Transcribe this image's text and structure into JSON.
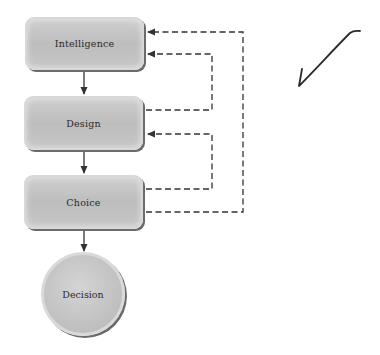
{
  "diagram": {
    "nodes": [
      {
        "id": "intelligence",
        "label": "Intelligence",
        "shape": "rounded-rect"
      },
      {
        "id": "design",
        "label": "Design",
        "shape": "rounded-rect"
      },
      {
        "id": "choice",
        "label": "Choice",
        "shape": "rounded-rect"
      },
      {
        "id": "decision",
        "label": "Decision",
        "shape": "circle"
      }
    ],
    "edges": [
      {
        "from": "intelligence",
        "to": "design",
        "style": "solid"
      },
      {
        "from": "design",
        "to": "choice",
        "style": "solid"
      },
      {
        "from": "choice",
        "to": "decision",
        "style": "solid"
      },
      {
        "from": "design",
        "to": "intelligence",
        "style": "dashed"
      },
      {
        "from": "choice",
        "to": "design",
        "style": "dashed"
      },
      {
        "from": "choice",
        "to": "intelligence",
        "style": "dashed"
      }
    ],
    "annotation": "handwritten-checkmark",
    "colors": {
      "node_fill": "#c4c4c4",
      "line": "#333333"
    }
  }
}
